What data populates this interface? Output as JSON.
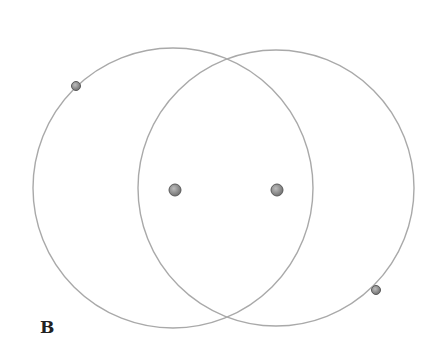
{
  "figure": {
    "label": "B",
    "colors": {
      "circle_stroke": "#a9a9a9",
      "dot_fill": "#8c8c8c",
      "dot_stroke": "#5a5a5a",
      "background": "#ffffff"
    },
    "circles": [
      {
        "name": "left-circle",
        "cx": 173,
        "cy": 188,
        "r": 140
      },
      {
        "name": "right-circle",
        "cx": 276,
        "cy": 188,
        "r": 138
      }
    ],
    "points": [
      {
        "name": "point-on-left-circle",
        "x": 76,
        "y": 86,
        "r": 4.5
      },
      {
        "name": "left-center-point",
        "x": 175,
        "y": 190,
        "r": 6
      },
      {
        "name": "right-center-point",
        "x": 277,
        "y": 190,
        "r": 6
      },
      {
        "name": "point-on-right-circle",
        "x": 376,
        "y": 290,
        "r": 4.5
      }
    ]
  }
}
